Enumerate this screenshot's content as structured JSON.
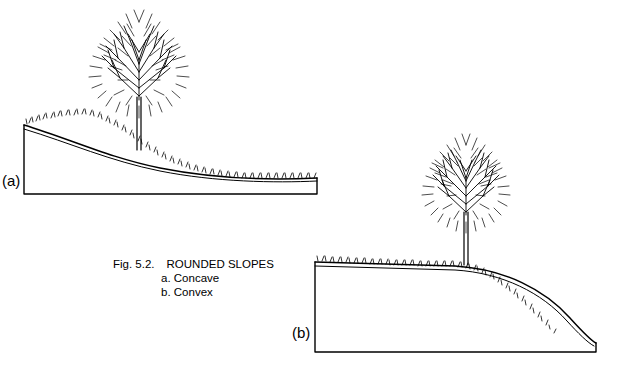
{
  "figure": {
    "number": "Fig. 5.2.",
    "title": "ROUNDED SLOPES",
    "sub_items": [
      "a. Concave",
      "b. Convex"
    ],
    "panels": [
      {
        "label": "(a)",
        "kind": "concave"
      },
      {
        "label": "(b)",
        "kind": "convex"
      }
    ],
    "colors": {
      "ink": "#000000",
      "background": "#ffffff"
    }
  }
}
